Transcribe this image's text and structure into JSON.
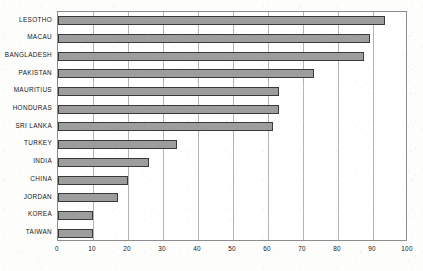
{
  "chart_data": {
    "type": "bar",
    "orientation": "horizontal",
    "title": "",
    "subtitle": "",
    "xlabel": "",
    "ylabel": "",
    "categories": [
      "LESOTHO",
      "MACAU",
      "BANGLADESH",
      "PAKISTAN",
      "MAURITIUS",
      "HONDURAS",
      "SRI LANKA",
      "TURKEY",
      "INDIA",
      "CHINA",
      "JORDAN",
      "KOREA",
      "TAIWAN"
    ],
    "values": [
      93.5,
      89,
      87.5,
      73,
      63,
      63,
      61.5,
      34,
      26,
      20,
      17,
      10,
      10
    ],
    "xlim": [
      0,
      100
    ],
    "xticks": [
      0,
      10,
      20,
      30,
      40,
      50,
      60,
      70,
      80,
      90,
      100
    ],
    "xtick_labels": [
      "0",
      "10",
      "20",
      "30",
      "40",
      "50",
      "60",
      "70",
      "80",
      "90",
      "100"
    ],
    "grid": true,
    "grid_axis": "x",
    "legend": false,
    "bar_color": "#9d9d9d",
    "bar_edge_color": "#3a3a3a",
    "frame_color": "#8d8d8d",
    "gridline_color": "#b4b4b4",
    "background_color": "#ffffff"
  }
}
